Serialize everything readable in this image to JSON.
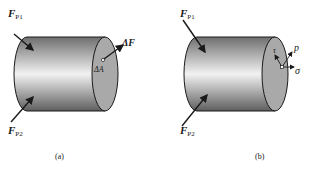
{
  "figure": {
    "panels": [
      {
        "id": "a",
        "caption": "(a)",
        "labels": {
          "force1": "F",
          "force1_sub": "P1",
          "force2": "F",
          "force2_sub": "P2",
          "delta_force": "ΔF",
          "delta_area": "ΔA"
        }
      },
      {
        "id": "b",
        "caption": "(b)",
        "labels": {
          "force1": "F",
          "force1_sub": "P1",
          "force2": "F",
          "force2_sub": "P2",
          "stress_total": "p",
          "stress_shear": "τ",
          "stress_normal": "σ"
        }
      }
    ],
    "colors": {
      "cylinder_dark": "#6e6e6e",
      "cylinder_light": "#f2f2f2",
      "end_face": "#a9a9a9",
      "stroke": "#1a1a1a"
    }
  }
}
